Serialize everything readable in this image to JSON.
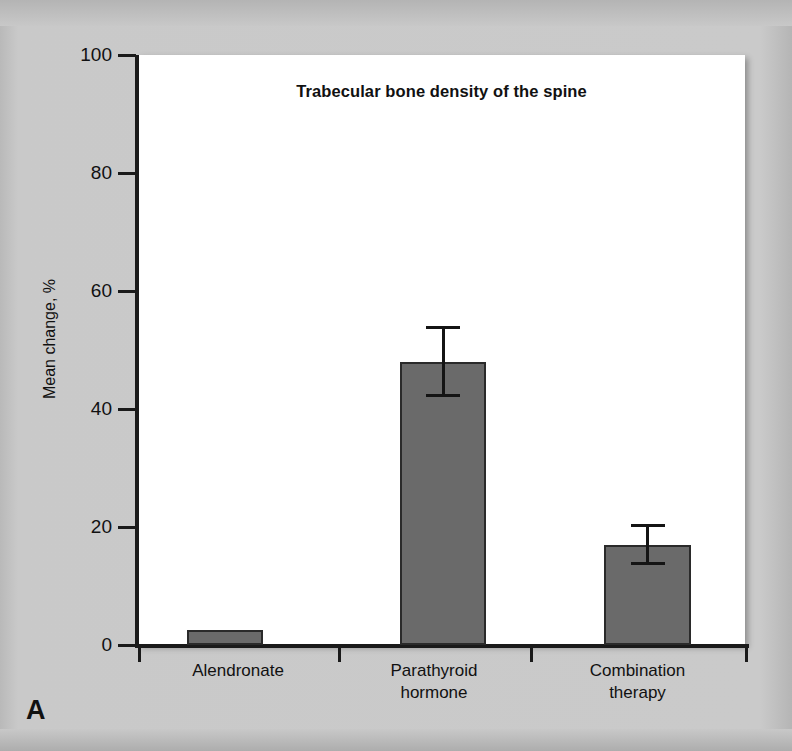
{
  "panel": {
    "letter": "A"
  },
  "chart_data": {
    "type": "bar",
    "title": "Trabecular bone density of the spine",
    "xlabel": "",
    "ylabel": "Mean change, %",
    "ylim": [
      0,
      100
    ],
    "yticks": [
      0,
      20,
      40,
      60,
      80,
      100
    ],
    "ytick_labels": [
      "0",
      "20",
      "40",
      "60",
      "80",
      "100"
    ],
    "grid": false,
    "legend": "none",
    "bar_color": "#6a6a6a",
    "categories": [
      "Alendronate",
      "Parathyroid hormone",
      "Combination therapy"
    ],
    "category_lines": [
      [
        "Alendronate"
      ],
      [
        "Parathyroid",
        "hormone"
      ],
      [
        "Combination",
        "therapy"
      ]
    ],
    "values": [
      2.5,
      48.0,
      17.0
    ],
    "errors": [
      null,
      6.0,
      3.5
    ],
    "error_high": [
      null,
      54.0,
      20.5
    ],
    "error_low": [
      null,
      42.0,
      13.5
    ]
  }
}
